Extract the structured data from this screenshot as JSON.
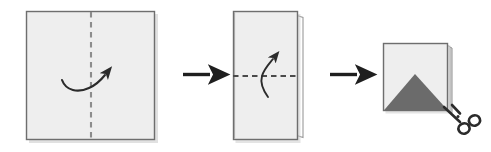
{
  "figure": {
    "type": "paper-folding-instruction-diagram",
    "background_color": "#ffffff",
    "step_count": 3,
    "connector_count": 2
  },
  "palette": {
    "paper_fill": "#eaeaea",
    "paper_fill_light": "#f1f1f1",
    "paper_outline": "#6e6e6e",
    "paper_edge_shadow": "#9a9a9a",
    "back_layer_fill": "#ffffff",
    "fold_line_color": "#8c8c8c",
    "motion_arrow_color": "#2b2b2b",
    "step_arrow_color": "#1f1f1f",
    "cut_triangle_fill": "#6b6b6b",
    "scissors_color": "#2b2b2b"
  },
  "steps": [
    {
      "index": 1,
      "name": "fold-square-vertically",
      "shape": "square",
      "description": "Full square sheet with a vertical dashed fold line down the middle and a curved arrow indicating folding the left half over to the right.",
      "sheet": {
        "x": 26,
        "y": 11,
        "width": 129,
        "height": 129
      },
      "fold_line": {
        "orientation": "vertical",
        "style": "dashed",
        "x": 91,
        "y1": 11,
        "y2": 140
      },
      "motion_arrow": {
        "name": "fold-right-arrow",
        "direction": "left-to-right",
        "curve": "dip-down-then-up"
      }
    },
    {
      "index": 2,
      "name": "fold-rectangle-horizontally",
      "shape": "vertical-rectangle",
      "description": "Sheet folded once into a tall rectangle, showing a back layer edge on the right, with a horizontal dashed fold line across the middle and a curved arrow indicating folding the bottom half upward.",
      "sheet": {
        "x": 233,
        "y": 11,
        "width": 65,
        "height": 129
      },
      "back_layer": {
        "x": 298,
        "y": 15,
        "width": 5,
        "height": 121
      },
      "fold_line": {
        "orientation": "horizontal",
        "style": "dashed",
        "y": 76,
        "x1": 233,
        "x2": 298
      },
      "motion_arrow": {
        "name": "fold-up-arrow",
        "direction": "bottom-to-top",
        "curve": "sweep-up"
      }
    },
    {
      "index": 3,
      "name": "cut-triangle-from-folded-square",
      "shape": "square",
      "description": "Twice-folded square packet with stacked layer edges on the right, a shaded triangle marked at the bottom indicating the region to cut, and scissors at the lower-right corner.",
      "sheet": {
        "x": 383,
        "y": 43,
        "width": 65,
        "height": 68
      },
      "layer_edges": 3,
      "cut_region": {
        "name": "cut-triangle",
        "shape": "triangle",
        "apex": {
          "x": 415,
          "y": 74
        },
        "base_left": {
          "x": 383,
          "y": 111
        },
        "base_right": {
          "x": 448,
          "y": 111
        }
      },
      "tool": {
        "name": "scissors-icon",
        "position": "bottom-right",
        "rings": 2
      }
    }
  ],
  "connectors": [
    {
      "index": 1,
      "name": "step-arrow-1-to-2",
      "direction": "right",
      "x": 183,
      "y": 74,
      "length": 32
    },
    {
      "index": 2,
      "name": "step-arrow-2-to-3",
      "direction": "right",
      "x": 330,
      "y": 74,
      "length": 32
    }
  ],
  "labels": {
    "step1": "Step 1",
    "step2": "Step 2",
    "step3": "Step 3",
    "alt_text": "Three-step diagram: fold a square sheet in half vertically, then fold the resulting rectangle in half horizontally, then cut a triangle from the folded packet with scissors."
  }
}
